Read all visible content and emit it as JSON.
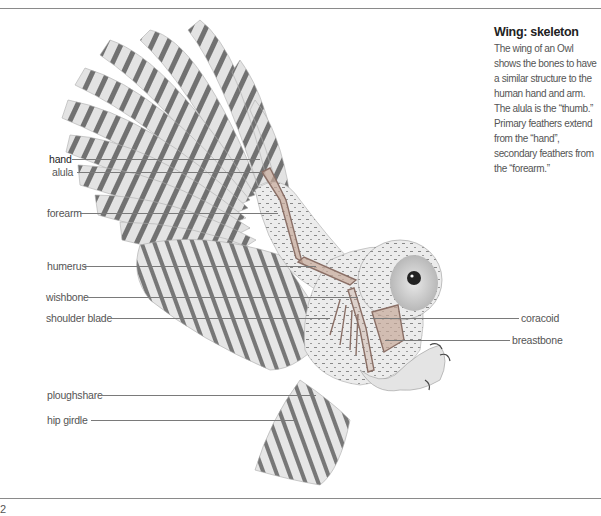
{
  "caption": {
    "title": "Wing: skeleton",
    "body": "The wing of an Owl shows the bones to have a similar structure to the human hand and arm. The alula is the “thumb.” Primary feathers extend from the “hand”, secondary feathers from the “forearm.”"
  },
  "labels_left": [
    {
      "id": "hand",
      "text": "hand",
      "y": 159,
      "x": 49,
      "line_from": 72,
      "line_to": 260
    },
    {
      "id": "alula",
      "text": "alula",
      "y": 172,
      "x": 52,
      "line_from": 77,
      "line_to": 262
    },
    {
      "id": "forearm",
      "text": "forearm",
      "y": 213,
      "x": 47,
      "line_from": 80,
      "line_to": 278
    },
    {
      "id": "humerus",
      "text": "humerus",
      "y": 266,
      "x": 47,
      "line_from": 84,
      "line_to": 316
    },
    {
      "id": "wishbone",
      "text": "wishbone",
      "y": 297,
      "x": 46,
      "line_from": 87,
      "line_to": 358
    },
    {
      "id": "shoulder-blade",
      "text": "shoulder blade",
      "y": 318,
      "x": 46,
      "line_from": 110,
      "line_to": 330
    },
    {
      "id": "ploughshare",
      "text": "ploughshare",
      "y": 395,
      "x": 47,
      "line_from": 101,
      "line_to": 316
    },
    {
      "id": "hip-girdle",
      "text": "hip girdle",
      "y": 420,
      "x": 47,
      "line_from": 91,
      "line_to": 296
    }
  ],
  "labels_right": [
    {
      "id": "coracoid",
      "text": "coracoid",
      "y": 318,
      "x": 521,
      "line_from": 370,
      "line_to": 519
    },
    {
      "id": "breastbone",
      "text": "breastbone",
      "y": 340,
      "x": 512,
      "line_from": 385,
      "line_to": 510
    }
  ],
  "page": {
    "number": "2"
  },
  "colors": {
    "rule": "#8a8a8a",
    "text": "#555555",
    "title": "#222222",
    "bone": "#c8a99a"
  }
}
